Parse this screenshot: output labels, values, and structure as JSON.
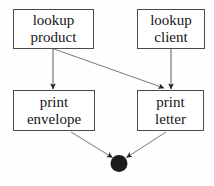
{
  "diagram": {
    "stroke_color": "#4a4a4a",
    "text_color": "#151515",
    "node_fill": "#ffffff",
    "final_node_color": "#1a1a1a",
    "nodes": [
      {
        "id": "lookup-product",
        "line1": "lookup",
        "line2": "product"
      },
      {
        "id": "lookup-client",
        "line1": "lookup",
        "line2": "client"
      },
      {
        "id": "print-envelope",
        "line1": "print",
        "line2": "envelope"
      },
      {
        "id": "print-letter",
        "line1": "print",
        "line2": "letter"
      }
    ],
    "final_node": {
      "id": "final-node",
      "shape": "filled-circle"
    },
    "edges": [
      {
        "id": "edge-lookup-product-to-print-envelope",
        "from": "lookup-product",
        "to": "print-envelope"
      },
      {
        "id": "edge-lookup-product-to-print-letter",
        "from": "lookup-product",
        "to": "print-letter"
      },
      {
        "id": "edge-lookup-client-to-print-letter",
        "from": "lookup-client",
        "to": "print-letter"
      },
      {
        "id": "edge-print-envelope-to-final",
        "from": "print-envelope",
        "to": "final-node"
      },
      {
        "id": "edge-print-letter-to-final",
        "from": "print-letter",
        "to": "final-node"
      }
    ]
  }
}
